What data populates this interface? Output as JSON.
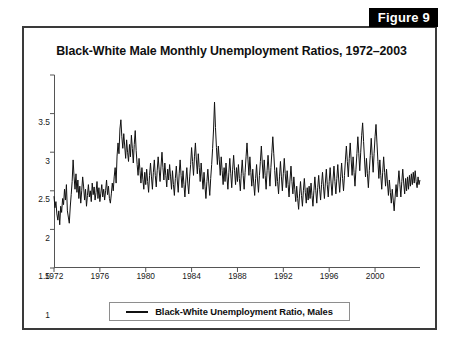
{
  "figure": {
    "tab_label": "Figure 9"
  },
  "chart_data": {
    "type": "line",
    "title": "Black-White Male Monthly Unemployment Ratios, 1972–2003",
    "xlabel": "",
    "ylabel": "",
    "xlim": [
      1972,
      2003.92
    ],
    "ylim": [
      1,
      3.5
    ],
    "grid": false,
    "legend_position": "bottom-center",
    "x_tick_labels": [
      "1972",
      "1976",
      "1980",
      "1984",
      "1988",
      "1992",
      "1996",
      "2000"
    ],
    "x_tick_values": [
      1972,
      1976,
      1980,
      1984,
      1988,
      1992,
      1996,
      2000
    ],
    "y_tick_labels": [
      "1",
      "1.5",
      "2",
      "2.5",
      "3",
      "3.5"
    ],
    "y_tick_values": [
      1,
      1.5,
      2,
      2.5,
      3,
      3.5
    ],
    "line_color": "#111111",
    "series": [
      {
        "name": "Black-White Unemployment Ratio, Males",
        "x_start": 1972.0,
        "x_step": 0.0833333,
        "values": [
          1.93,
          1.78,
          1.86,
          1.7,
          1.62,
          1.74,
          1.56,
          1.8,
          1.72,
          1.9,
          1.82,
          2.02,
          1.88,
          2.08,
          1.74,
          1.66,
          1.58,
          1.79,
          1.95,
          2.12,
          2.4,
          2.18,
          2.02,
          2.22,
          1.98,
          2.14,
          1.9,
          2.06,
          1.84,
          2.0,
          2.18,
          2.05,
          1.88,
          2.02,
          1.8,
          1.94,
          2.08,
          1.92,
          2.0,
          1.86,
          2.1,
          1.95,
          2.05,
          1.88,
          1.98,
          2.12,
          1.9,
          2.04,
          1.86,
          1.97,
          2.08,
          1.92,
          2.02,
          1.88,
          2.0,
          2.14,
          1.95,
          2.06,
          1.9,
          1.84,
          1.96,
          2.1,
          2.0,
          2.18,
          2.3,
          2.1,
          2.45,
          2.62,
          2.48,
          2.8,
          2.92,
          2.7,
          2.55,
          2.74,
          2.58,
          2.42,
          2.66,
          2.5,
          2.38,
          2.6,
          2.44,
          2.72,
          2.55,
          2.36,
          2.6,
          2.78,
          2.52,
          2.34,
          2.2,
          2.42,
          2.26,
          2.1,
          2.3,
          2.15,
          2.02,
          2.24,
          2.08,
          2.28,
          2.12,
          1.98,
          2.2,
          2.36,
          2.18,
          2.02,
          2.24,
          2.4,
          2.2,
          2.05,
          2.26,
          2.44,
          2.28,
          2.12,
          2.32,
          2.5,
          2.3,
          2.14,
          2.36,
          2.2,
          2.05,
          2.28,
          2.14,
          2.34,
          2.18,
          2.02,
          2.26,
          2.08,
          1.94,
          2.16,
          2.32,
          2.14,
          1.98,
          2.22,
          2.4,
          2.2,
          2.04,
          2.26,
          2.08,
          1.92,
          2.14,
          2.3,
          2.1,
          1.96,
          2.18,
          2.34,
          2.56,
          2.38,
          2.2,
          2.44,
          2.62,
          2.4,
          2.22,
          2.48,
          2.3,
          2.12,
          2.36,
          2.18,
          2.02,
          2.24,
          2.06,
          1.9,
          2.12,
          2.28,
          2.1,
          1.94,
          2.16,
          2.34,
          2.55,
          2.8,
          3.15,
          2.82,
          2.56,
          2.34,
          2.58,
          2.4,
          2.2,
          2.44,
          2.26,
          2.08,
          2.3,
          2.12,
          2.36,
          2.18,
          2.02,
          2.24,
          2.42,
          2.22,
          2.04,
          2.28,
          2.46,
          2.26,
          2.08,
          2.3,
          2.12,
          2.34,
          2.16,
          2.0,
          2.22,
          2.4,
          2.2,
          2.02,
          2.24,
          2.44,
          2.62,
          2.4,
          2.2,
          2.44,
          2.24,
          2.06,
          2.28,
          2.1,
          1.94,
          2.16,
          2.34,
          2.14,
          1.98,
          2.2,
          2.38,
          2.58,
          2.36,
          2.16,
          2.4,
          2.2,
          2.02,
          2.26,
          2.46,
          2.26,
          2.06,
          2.3,
          2.5,
          2.7,
          2.48,
          2.26,
          2.06,
          2.3,
          2.12,
          1.96,
          2.18,
          2.38,
          2.18,
          2.0,
          2.22,
          2.42,
          2.22,
          2.04,
          2.26,
          2.08,
          1.92,
          2.14,
          2.32,
          2.12,
          1.96,
          2.18,
          2.02,
          1.86,
          2.06,
          1.9,
          1.76,
          1.96,
          2.12,
          1.94,
          1.8,
          2.0,
          2.16,
          1.98,
          1.84,
          2.04,
          1.88,
          2.06,
          1.9,
          2.1,
          1.94,
          1.8,
          2.0,
          2.18,
          2.0,
          1.84,
          2.04,
          2.2,
          2.02,
          1.88,
          2.08,
          2.24,
          2.06,
          1.9,
          2.1,
          2.28,
          2.08,
          1.92,
          2.12,
          2.3,
          2.1,
          1.94,
          2.14,
          2.32,
          2.12,
          1.96,
          2.16,
          2.34,
          2.14,
          1.98,
          2.18,
          2.36,
          2.16,
          2.0,
          2.2,
          2.4,
          2.58,
          2.38,
          2.18,
          2.42,
          2.62,
          2.4,
          2.2,
          2.44,
          2.24,
          2.06,
          2.28,
          2.48,
          2.7,
          2.48,
          2.26,
          2.5,
          2.72,
          2.88,
          2.64,
          2.4,
          2.18,
          2.42,
          2.22,
          2.04,
          2.26,
          2.46,
          2.68,
          2.46,
          2.24,
          2.48,
          2.7,
          2.86,
          2.62,
          2.38,
          2.16,
          2.4,
          2.2,
          2.02,
          2.24,
          2.44,
          2.24,
          2.06,
          2.28,
          2.1,
          1.94,
          2.14,
          1.98,
          1.84,
          2.02,
          1.88,
          1.74,
          1.92,
          2.08,
          1.92,
          2.1,
          2.26,
          2.08,
          1.92,
          2.12,
          2.28,
          2.1,
          1.96,
          2.16,
          2.0,
          2.18,
          2.02,
          2.2,
          2.06,
          2.22,
          2.08,
          2.24,
          2.1,
          2.26,
          2.12,
          2.04,
          2.18,
          2.08,
          2.14
        ]
      }
    ]
  },
  "legend": {
    "label": "Black-White Unemployment Ratio, Males"
  }
}
